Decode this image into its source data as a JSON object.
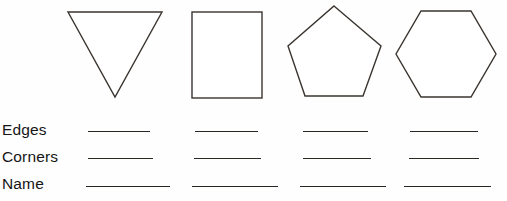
{
  "worksheet": {
    "title": "Shapes attributes worksheet",
    "background_color": "#ffffff",
    "ink_color": "#2a2723",
    "width": 507,
    "height": 201
  },
  "shapes": [
    {
      "name": "triangle",
      "label": "triangle",
      "sides": 3,
      "corners": 3,
      "orientation": "point-down",
      "bounds": {
        "x": 68,
        "y": 12,
        "width": 94,
        "height": 86
      }
    },
    {
      "name": "rectangle",
      "label": "rectangle",
      "sides": 4,
      "corners": 4,
      "orientation": "upright",
      "bounds": {
        "x": 192,
        "y": 12,
        "width": 70,
        "height": 86
      }
    },
    {
      "name": "pentagon",
      "label": "pentagon",
      "sides": 5,
      "corners": 5,
      "orientation": "point-up",
      "bounds": {
        "x": 289,
        "y": 6,
        "width": 92,
        "height": 92
      }
    },
    {
      "name": "hexagon",
      "label": "hexagon",
      "sides": 6,
      "corners": 6,
      "orientation": "flat-top",
      "bounds": {
        "x": 395,
        "y": 11,
        "width": 102,
        "height": 86
      }
    }
  ],
  "rows": [
    {
      "key": "edges",
      "label": "Edges",
      "label_top": 0,
      "blanks": [
        {
          "left": 88,
          "width": 62,
          "top": 21
        },
        {
          "left": 195,
          "width": 63,
          "top": 21
        },
        {
          "left": 303,
          "width": 65,
          "top": 21
        },
        {
          "left": 410,
          "width": 68,
          "top": 21
        }
      ]
    },
    {
      "key": "corners",
      "label": "Corners",
      "label_top": 27,
      "blanks": [
        {
          "left": 88,
          "width": 65,
          "top": 48
        },
        {
          "left": 194,
          "width": 67,
          "top": 48
        },
        {
          "left": 303,
          "width": 68,
          "top": 48
        },
        {
          "left": 409,
          "width": 70,
          "top": 48
        }
      ]
    },
    {
      "key": "name",
      "label": "Name",
      "label_top": 54,
      "blanks": [
        {
          "left": 86,
          "width": 84,
          "top": 76
        },
        {
          "left": 192,
          "width": 86,
          "top": 76
        },
        {
          "left": 300,
          "width": 86,
          "top": 76
        },
        {
          "left": 404,
          "width": 87,
          "top": 76
        }
      ]
    }
  ],
  "geometry": {
    "triangle_points": "68,12 162,12 115,97",
    "rectangle": {
      "x": 192,
      "y": 12,
      "width": 70,
      "height": 86
    },
    "pentagon_points": "334,6 381,46 363,96 305,96 288,46",
    "hexagon_points": "421,11 471,11 496,54 471,97 421,97 396,54"
  }
}
